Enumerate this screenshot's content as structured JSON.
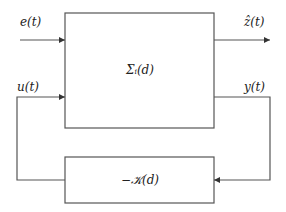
{
  "diagram": {
    "type": "block-diagram",
    "colors": {
      "line": "#555555",
      "text": "#222222",
      "background": "#ffffff"
    },
    "blocks": [
      {
        "id": "plant",
        "label": "Σᵢ(d)"
      },
      {
        "id": "controller",
        "label": "−𝒦(d)"
      }
    ],
    "signals": {
      "e": "e(t)",
      "z_hat": "ẑ(t)",
      "u": "u(t)",
      "y": "y(t)"
    },
    "connections": [
      {
        "from": "external",
        "to": "plant",
        "signal": "e(t)"
      },
      {
        "from": "plant",
        "to": "external",
        "signal": "ẑ(t)"
      },
      {
        "from": "plant",
        "to": "controller",
        "signal": "y(t)"
      },
      {
        "from": "controller",
        "to": "plant",
        "signal": "u(t)"
      }
    ]
  }
}
